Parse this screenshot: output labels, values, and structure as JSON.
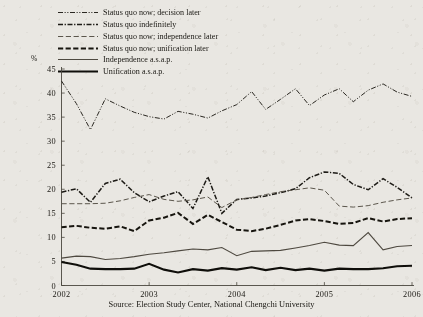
{
  "figure": {
    "source_note": "Source: Election Study Center, National Chengchi University",
    "y_axis_unit": "%"
  },
  "chart_data": {
    "type": "line",
    "title": "",
    "subtitle": "",
    "xlabel": "",
    "ylabel": "%",
    "ylim": [
      0,
      45
    ],
    "xlim": [
      2002,
      2006
    ],
    "grid": false,
    "legend_position": "top-left",
    "y_ticks": [
      "0",
      "5",
      "10",
      "15",
      "20",
      "25",
      "30",
      "35",
      "40",
      "45"
    ],
    "y_tick_values": [
      0,
      5,
      10,
      15,
      20,
      25,
      30,
      35,
      40,
      45
    ],
    "x_ticks": [
      "2002",
      "2003",
      "2004",
      "2005",
      "2006"
    ],
    "x_tick_values": [
      2002,
      2003,
      2004,
      2005,
      2006
    ],
    "x": [
      2002.0,
      2002.17,
      2002.33,
      2002.5,
      2002.67,
      2002.83,
      2003.0,
      2003.17,
      2003.33,
      2003.5,
      2003.67,
      2003.83,
      2004.0,
      2004.17,
      2004.33,
      2004.5,
      2004.67,
      2004.83,
      2005.0,
      2005.17,
      2005.33,
      2005.5,
      2005.67,
      2005.83,
      2006.0
    ],
    "series": [
      {
        "name": "Status quo now; decision later",
        "style": "dash-dot-dot",
        "color": "#2a2721",
        "width": 1.0,
        "values": [
          42.5,
          37.8,
          32.4,
          38.8,
          37.3,
          36.0,
          35.1,
          34.6,
          36.2,
          35.6,
          34.8,
          36.3,
          37.6,
          40.3,
          36.6,
          38.7,
          40.9,
          37.4,
          39.6,
          40.9,
          38.2,
          40.6,
          41.9,
          40.2,
          39.3
        ]
      },
      {
        "name": "Status quo indefinitely",
        "style": "dash-dot",
        "color": "#1d1b16",
        "width": 1.5,
        "values": [
          19.4,
          20.1,
          17.3,
          21.2,
          22.1,
          19.3,
          17.4,
          18.6,
          19.5,
          16.0,
          22.6,
          15.0,
          17.9,
          18.2,
          18.6,
          19.3,
          20.1,
          22.4,
          23.6,
          23.3,
          21.0,
          19.9,
          22.2,
          20.4,
          18.2
        ]
      },
      {
        "name": "Status quo now; independence later",
        "style": "dash-long",
        "color": "#5b564c",
        "width": 1.0,
        "values": [
          17.0,
          17.0,
          17.0,
          17.1,
          17.6,
          18.3,
          18.9,
          17.9,
          17.5,
          17.8,
          18.4,
          16.2,
          17.8,
          18.3,
          18.9,
          19.5,
          19.9,
          20.3,
          19.8,
          16.5,
          16.3,
          16.6,
          17.3,
          17.8,
          18.2
        ]
      },
      {
        "name": "Status quo now; unification later",
        "style": "dash-heavy",
        "color": "#17150f",
        "width": 2.0,
        "values": [
          12.1,
          12.4,
          12.0,
          11.8,
          12.3,
          11.3,
          13.5,
          14.1,
          15.1,
          12.8,
          14.7,
          13.2,
          11.6,
          11.3,
          11.8,
          12.6,
          13.5,
          13.8,
          13.4,
          12.8,
          13.0,
          14.0,
          13.3,
          13.8,
          14.0
        ]
      },
      {
        "name": "Independence a.s.a.p.",
        "style": "solid-thin",
        "color": "#4e4940",
        "width": 1.1,
        "values": [
          5.7,
          6.1,
          6.0,
          5.4,
          5.6,
          6.0,
          6.5,
          6.8,
          7.2,
          7.6,
          7.4,
          7.9,
          6.2,
          7.1,
          7.2,
          7.3,
          7.8,
          8.3,
          9.0,
          8.4,
          8.3,
          11.0,
          7.4,
          8.1,
          8.3
        ]
      },
      {
        "name": "Unification a.s.a.p.",
        "style": "solid-thick",
        "color": "#0f0e0a",
        "width": 2.1,
        "values": [
          4.9,
          4.3,
          3.5,
          3.4,
          3.4,
          3.5,
          4.5,
          3.3,
          2.7,
          3.4,
          3.1,
          3.6,
          3.3,
          3.8,
          3.2,
          3.7,
          3.2,
          3.5,
          3.1,
          3.5,
          3.4,
          3.4,
          3.6,
          4.0,
          4.1
        ]
      }
    ],
    "legend": [
      "Status quo now; decision later",
      "Status quo indefinitely",
      "Status quo now; independence later",
      "Status quo now; unification later",
      "Independence a.s.a.p.",
      "Unification a.s.a.p."
    ]
  }
}
